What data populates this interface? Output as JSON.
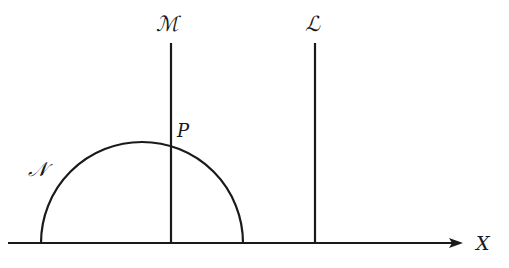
{
  "diagram": {
    "labels": {
      "M": "ℳ",
      "L": "ℒ",
      "N": "𝒩",
      "P": "P",
      "X": "X"
    },
    "colors": {
      "stroke": "#1a1a1a",
      "background": "#ffffff"
    },
    "elements": [
      {
        "id": "M",
        "type": "vertical-line",
        "x": 171,
        "y_top": 43,
        "y_bottom": 243
      },
      {
        "id": "L",
        "type": "vertical-line",
        "x": 315,
        "y_top": 43,
        "y_bottom": 243
      },
      {
        "id": "N",
        "type": "semicircle",
        "center_x": 142,
        "baseline_y": 243,
        "radius": 101
      },
      {
        "id": "X",
        "type": "axis-arrow",
        "x_start": 8,
        "x_end": 462,
        "y": 243
      },
      {
        "id": "P",
        "type": "point",
        "description": "intersection of M and N"
      }
    ]
  }
}
